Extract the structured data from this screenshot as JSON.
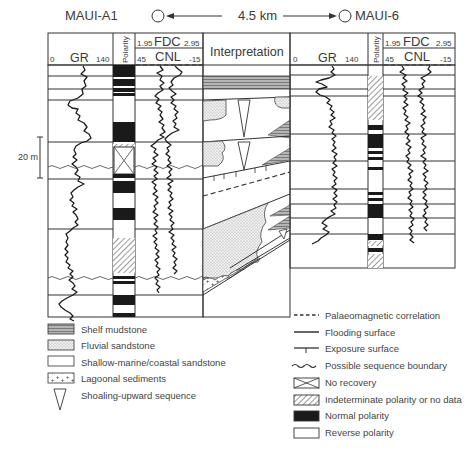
{
  "figure": {
    "wells": [
      {
        "name": "MAUI-A1",
        "position": "left"
      },
      {
        "name": "MAUI-6",
        "position": "right"
      }
    ],
    "distance_label": "4.5 km",
    "scale_bar_label": "20 m"
  },
  "left_well": {
    "gr": {
      "label": "GR",
      "min": "0",
      "max": "140"
    },
    "polarity_label": "Polarity",
    "fdc": {
      "label": "FDC",
      "min": "1.95",
      "max": "2.95"
    },
    "cnl": {
      "label": "CNL",
      "min": "45",
      "max": "-15"
    }
  },
  "interpretation_label": "Interpretation",
  "right_well": {
    "gr": {
      "label": "GR",
      "min": "0",
      "max": "140"
    },
    "polarity_label": "Polarity",
    "fdc": {
      "label": "FDC",
      "min": "1.95",
      "max": "2.95"
    },
    "cnl": {
      "label": "CNL",
      "min": "45",
      "max": "-15"
    }
  },
  "legend_left": [
    {
      "symbol": "shelf-mudstone",
      "label": "Shelf mudstone"
    },
    {
      "symbol": "fluvial-sandstone",
      "label": "Fluvial sandstone"
    },
    {
      "symbol": "shallow-marine-sandstone",
      "label": "Shallow-marine/coastal sandstone"
    },
    {
      "symbol": "lagoonal-sediments",
      "label": "Lagoonal sediments"
    },
    {
      "symbol": "shoaling-upward-triangle",
      "label": "Shoaling-upward sequence"
    }
  ],
  "legend_right": [
    {
      "symbol": "dashed-line",
      "label": "Palaeomagnetic correlation"
    },
    {
      "symbol": "solid-line",
      "label": "Flooding surface"
    },
    {
      "symbol": "exposure-tick-line",
      "label": "Exposure surface"
    },
    {
      "symbol": "wavy-line",
      "label": "Possible sequence boundary"
    },
    {
      "symbol": "crossed-box",
      "label": "No recovery"
    },
    {
      "symbol": "hatched-box",
      "label": "Indeterminate polarity or no data"
    },
    {
      "symbol": "black-box",
      "label": "Normal polarity"
    },
    {
      "symbol": "white-box",
      "label": "Reverse polarity"
    }
  ],
  "colors": {
    "ink": "#333333",
    "shelf_mudstone_fill": "#9a9a9a",
    "fluvial_fill": "#d9d9d9",
    "normal_polarity": "#1a1a1a",
    "background": "#ffffff"
  }
}
